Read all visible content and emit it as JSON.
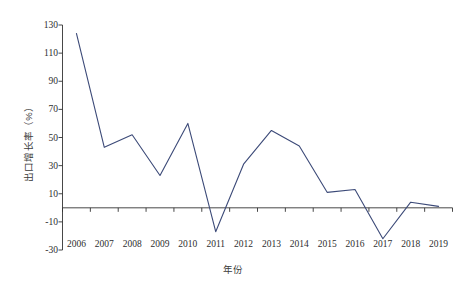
{
  "chart_data": {
    "type": "line",
    "title": "",
    "xlabel": "年份",
    "ylabel": "出口增长率（%）",
    "categories": [
      "2006",
      "2007",
      "2008",
      "2009",
      "2010",
      "2011",
      "2012",
      "2013",
      "2014",
      "2015",
      "2016",
      "2017",
      "2018",
      "2019"
    ],
    "series": [
      {
        "name": "出口增长率",
        "color": "#3c4a78",
        "values": [
          124,
          43,
          52,
          23,
          60,
          -17,
          31,
          55,
          44,
          11,
          13,
          -22,
          4,
          1
        ]
      }
    ],
    "ylim": [
      -30,
      130
    ],
    "ytick_values": [
      -30,
      -10,
      10,
      30,
      50,
      70,
      90,
      110,
      130
    ],
    "ytick_labels": [
      "-30",
      "-10",
      "10",
      "30",
      "50",
      "70",
      "90",
      "110",
      "130"
    ],
    "grid": false,
    "legend": "none",
    "zero_line": true,
    "axis_color": "#333333",
    "background": "#ffffff"
  }
}
